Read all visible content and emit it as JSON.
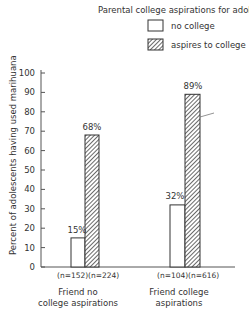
{
  "chart_data": {
    "type": "bar",
    "title": "Parental college aspirations for adolescent",
    "xlabel": "",
    "ylabel": "Percent of adolescents having used marihuana",
    "ylim": [
      0,
      100
    ],
    "yticks": [
      0,
      10,
      20,
      30,
      40,
      50,
      60,
      70,
      80,
      90,
      100
    ],
    "grid": false,
    "legend_position": "top-right",
    "categories": [
      "Friend no college aspirations",
      "Friend college aspirations"
    ],
    "category_lines": [
      [
        "Friend no",
        "college aspirations"
      ],
      [
        "Friend college",
        "aspirations"
      ]
    ],
    "series": [
      {
        "name": "no college",
        "values": [
          15,
          32
        ],
        "labels": [
          "15%",
          "32%"
        ],
        "n": [
          "(n=152)",
          "(n=104)"
        ],
        "fill": "white"
      },
      {
        "name": "aspires to college",
        "values": [
          68,
          89
        ],
        "labels": [
          "68%",
          "89%"
        ],
        "n": [
          "(n=224)",
          "(n=616)"
        ],
        "fill": "hatched"
      }
    ]
  },
  "legend": {
    "title": "Parental college aspirations for adolescent",
    "items": [
      "no college",
      "aspires to college"
    ]
  },
  "ytick_labels": [
    "0",
    "10",
    "20",
    "30",
    "40",
    "50",
    "60",
    "70",
    "80",
    "90",
    "100"
  ],
  "colors": {
    "ink": "#333333",
    "background": "#ffffff"
  }
}
